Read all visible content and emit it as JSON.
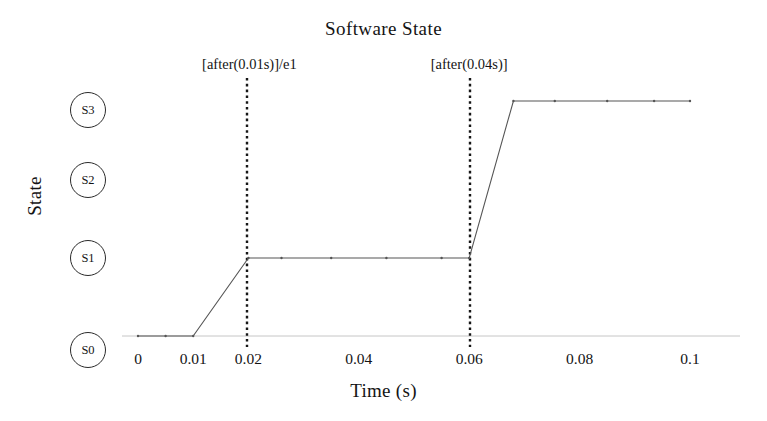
{
  "chart_data": {
    "type": "line",
    "title": "Software State",
    "xlabel": "Time (s)",
    "ylabel": "State",
    "xlim": [
      0,
      0.105
    ],
    "ylim": [
      0,
      3
    ],
    "grid": false,
    "legend": null,
    "x_ticks": [
      "0",
      "0.01",
      "0.02",
      "0.04",
      "0.06",
      "0.08",
      "0.1"
    ],
    "x_tick_values": [
      0,
      0.01,
      0.02,
      0.04,
      0.06,
      0.08,
      0.1
    ],
    "y_ticks": [
      "S0",
      "S1",
      "S2",
      "S3"
    ],
    "y_tick_values": [
      0,
      1,
      2,
      3
    ],
    "series": [
      {
        "name": "Software State",
        "x": [
          0,
          0.005,
          0.01,
          0.02,
          0.026,
          0.035,
          0.045,
          0.055,
          0.06,
          0.068,
          0.0755,
          0.085,
          0.0935,
          0.1
        ],
        "y": [
          0,
          0,
          0,
          1,
          1,
          1,
          1,
          1,
          1,
          3,
          3,
          3,
          3,
          3
        ]
      }
    ],
    "annotations": [
      {
        "text": "[after(0.01s)]/e1",
        "x": 0.02,
        "y_top": 3.55,
        "marker_line": "dotted-vertical"
      },
      {
        "text": "[after(0.04s)]",
        "x": 0.06,
        "y_top": 3.55,
        "marker_line": "dotted-vertical"
      }
    ],
    "baseline": {
      "label": "S0 baseline",
      "y": 0,
      "style": "faint-solid"
    },
    "colors": {
      "line": "#4a4a4a",
      "baseline": "#bdbdbd",
      "guide": "#1a1a1a",
      "text": "#141414",
      "background": "#ffffff"
    }
  }
}
